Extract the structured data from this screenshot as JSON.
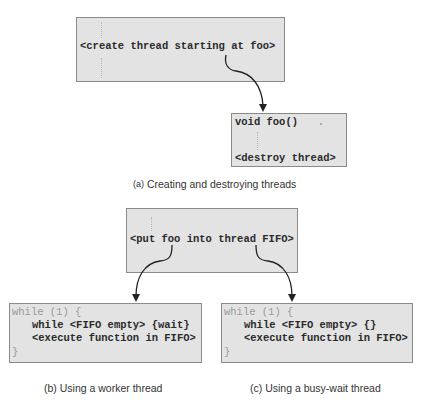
{
  "diagram": {
    "panel_a": {
      "caller_box": {
        "lines": [
          "<create thread starting at foo>"
        ]
      },
      "callee_box": {
        "lines": [
          "void foo()",
          "<destroy thread>"
        ]
      },
      "caption_label": "(a)",
      "caption_text": "Creating and destroying threads"
    },
    "panel_bc": {
      "caller_box": {
        "lines": [
          "<put foo into thread FIFO>"
        ]
      },
      "worker_box": {
        "lines": [
          "while (1) {",
          "while <FIFO empty> {wait}",
          "<execute function in FIFO>",
          "}"
        ]
      },
      "busywait_box": {
        "lines": [
          "while (1) {",
          "while <FIFO empty> {}",
          "<execute function in FIFO>",
          "}"
        ]
      },
      "caption_b": "(b) Using a worker thread",
      "caption_c": "(c) Using a busy-wait thread"
    },
    "colors": {
      "box_fill": "#e3e3e3",
      "box_border": "#8a8a8a",
      "arrow": "#222222",
      "text": "#2a2a2a",
      "dim_text": "#9a9a9a"
    }
  }
}
